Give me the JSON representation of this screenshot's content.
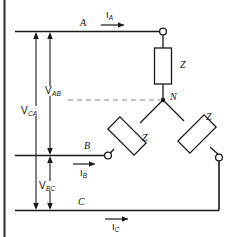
{
  "figure": {
    "kind": "three-phase-wye-circuit-diagram",
    "stroke_color": "#1a1a1a",
    "background_color": "#ffffff",
    "dashed_color": "#8a8a8a",
    "frame_color": "#2b2b2b"
  },
  "lines": {
    "phase_a_label": "A",
    "phase_b_label": "B",
    "phase_c_label": "C",
    "neutral_label": "N"
  },
  "currents": {
    "ia": {
      "symbol": "I",
      "sub": "A"
    },
    "ib": {
      "symbol": "I",
      "sub": "B"
    },
    "ic": {
      "symbol": "I",
      "sub": "C"
    }
  },
  "impedances": {
    "z_a": "Z",
    "z_b": "Z",
    "z_c": "Z"
  },
  "voltages": {
    "vab": {
      "symbol": "V",
      "sub": "AB"
    },
    "vbc": {
      "symbol": "V",
      "sub": "BC"
    },
    "vca": {
      "symbol": "V",
      "sub": "CA"
    }
  }
}
